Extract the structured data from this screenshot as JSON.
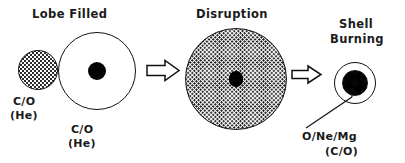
{
  "figure": {
    "background_color": "#ffffff",
    "ink_color": "#111111",
    "width": 405,
    "height": 163
  },
  "stages": [
    {
      "id": "lobe-filled",
      "heading": "Lobe Filled",
      "bodies": [
        {
          "id": "donor",
          "label_line1": "C/O",
          "label_line2": "(He)",
          "fill": "stipple-light",
          "cx": 38,
          "cy": 70,
          "r": 20
        },
        {
          "id": "accretor",
          "label_line1": "C/O",
          "label_line2": "(He)",
          "fill": "white-outline",
          "cx": 97,
          "cy": 71,
          "r": 39,
          "core_r": 9,
          "core_fill": "stipple-dense"
        }
      ]
    },
    {
      "id": "disruption",
      "heading": "Disruption",
      "bodies": [
        {
          "id": "merged-envelope",
          "fill": "stipple-med",
          "cx": 236,
          "cy": 79,
          "r": 51,
          "core_rx": 7,
          "core_ry": 8,
          "core_fill": "stipple-dense"
        }
      ]
    },
    {
      "id": "shell-burning",
      "heading_line1": "Shell",
      "heading_line2": "Burning",
      "bodies": [
        {
          "id": "remnant",
          "label_line1": "O/Ne/Mg",
          "label_line2": "(C/O)",
          "fill": "white-outline",
          "cx": 355,
          "cy": 83,
          "r": 21,
          "core_r": 13,
          "core_fill": "stipple-core"
        }
      ]
    }
  ],
  "arrows": [
    {
      "id": "arrow-1",
      "from_stage": "lobe-filled",
      "to_stage": "disruption",
      "x1": 147,
      "x2": 178,
      "y": 70,
      "style": "hollow-block"
    },
    {
      "id": "arrow-2",
      "from_stage": "disruption",
      "to_stage": "shell-burning",
      "x1": 292,
      "x2": 321,
      "y": 74,
      "style": "hollow-block"
    }
  ],
  "leader_line": {
    "id": "remnant-leader",
    "from_x": 306,
    "from_y": 128,
    "to_x": 352,
    "to_y": 96
  }
}
